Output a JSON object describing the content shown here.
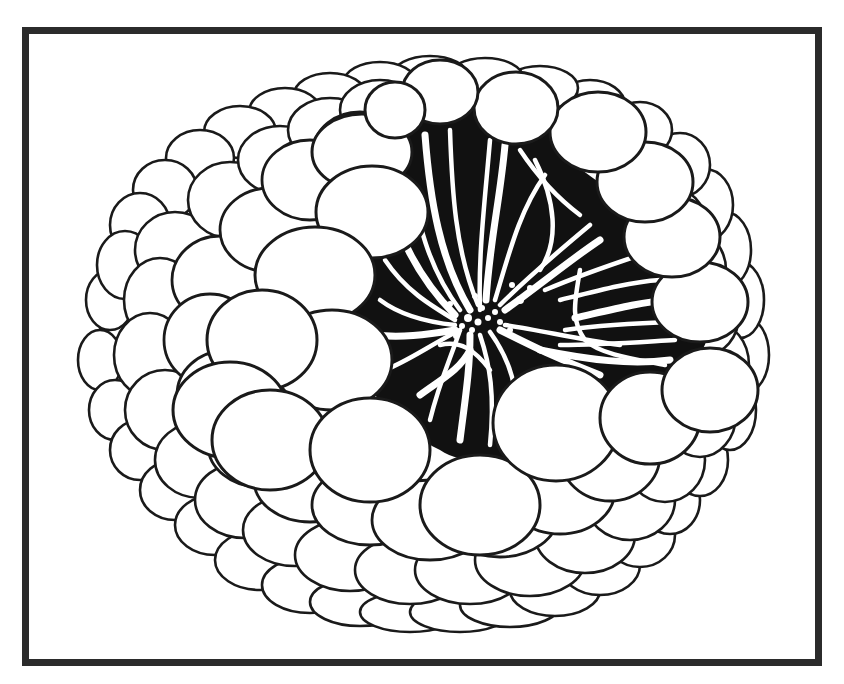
{
  "figure": {
    "width": 844,
    "height": 684,
    "background": "#ffffff",
    "ink": "#1a1a1a",
    "frame": {
      "x": 22,
      "y": 27,
      "w": 800,
      "h": 639,
      "stroke": 7,
      "color": "#2b2b2b"
    },
    "cavity": {
      "fill": "#111111",
      "path": "M 395 120 C 440 95 520 100 560 125 C 620 150 680 190 700 240 C 720 290 720 330 690 370 C 660 410 600 420 560 440 C 520 460 470 470 440 450 C 400 430 370 400 360 360 C 350 320 350 260 360 210 C 368 170 375 135 395 120 Z"
    },
    "strands": [
      "M 425 135 C 430 200 440 260 470 310",
      "M 450 130 C 452 190 455 250 478 305",
      "M 490 140 C 485 200 478 255 480 310",
      "M 505 145 C 500 200 490 240 486 300",
      "M 520 150 C 540 180 560 200 580 215",
      "M 535 160 C 555 200 560 240 540 270",
      "M 560 150 C 590 170 610 190 640 200",
      "M 545 175 C 520 210 510 250 495 300",
      "M 590 225 C 560 250 530 275 500 305",
      "M 600 240 C 570 260 540 285 505 310",
      "M 640 255 C 610 265 580 275 545 290",
      "M 660 280 C 630 282 600 290 560 300",
      "M 670 300 C 640 302 610 310 575 318",
      "M 675 322 C 640 323 600 325 565 330",
      "M 675 340 C 640 342 600 345 560 345",
      "M 670 360 C 630 365 590 360 540 350",
      "M 580 270 C 575 300 570 320 585 340 C 600 355 640 360 665 365",
      "M 410 180 C 420 230 430 270 460 310",
      "M 395 220 C 410 260 430 290 455 315",
      "M 385 260 C 405 290 430 305 455 320",
      "M 380 300 C 400 315 425 322 455 325",
      "M 375 335 C 400 338 425 335 455 330",
      "M 385 370 C 410 360 430 345 460 330",
      "M 460 330 C 450 360 440 380 430 420",
      "M 470 335 C 470 370 465 400 460 440",
      "M 480 335 C 490 365 495 395 490 445",
      "M 490 332 C 510 360 520 390 515 430",
      "M 500 330 C 530 345 560 360 600 375",
      "M 505 325 C 540 330 580 340 620 345",
      "M 440 345 C 460 340 475 350 490 370",
      "M 420 395 C 440 380 460 370 470 350"
    ],
    "granules": [
      [
        468,
        318,
        4
      ],
      [
        478,
        322,
        3.5
      ],
      [
        488,
        318,
        3
      ],
      [
        472,
        330,
        3
      ],
      [
        462,
        326,
        3
      ],
      [
        495,
        312,
        3
      ],
      [
        482,
        308,
        3
      ],
      [
        500,
        322,
        3
      ],
      [
        456,
        336,
        3
      ],
      [
        510,
        330,
        3
      ],
      [
        520,
        300,
        4
      ],
      [
        530,
        288,
        3
      ],
      [
        512,
        285,
        3
      ],
      [
        475,
        296,
        3
      ],
      [
        450,
        304,
        3
      ]
    ],
    "cell_layers": [
      {
        "name": "outer-rim",
        "cells": [
          [
            130,
            330,
            30,
            40
          ],
          [
            110,
            300,
            24,
            30
          ],
          [
            100,
            360,
            22,
            30
          ],
          [
            115,
            410,
            26,
            30
          ],
          [
            140,
            450,
            30,
            30
          ],
          [
            175,
            490,
            35,
            30
          ],
          [
            215,
            525,
            40,
            30
          ],
          [
            260,
            560,
            45,
            30
          ],
          [
            310,
            585,
            48,
            28
          ],
          [
            360,
            602,
            50,
            24
          ],
          [
            410,
            612,
            50,
            20
          ],
          [
            460,
            612,
            50,
            20
          ],
          [
            510,
            605,
            50,
            22
          ],
          [
            555,
            590,
            45,
            26
          ],
          [
            600,
            565,
            40,
            30
          ],
          [
            640,
            535,
            35,
            32
          ],
          [
            670,
            500,
            30,
            34
          ],
          [
            700,
            460,
            28,
            36
          ],
          [
            730,
            410,
            26,
            40
          ],
          [
            745,
            355,
            24,
            38
          ],
          [
            740,
            300,
            24,
            38
          ],
          [
            725,
            250,
            26,
            38
          ],
          [
            705,
            205,
            28,
            36
          ],
          [
            680,
            165,
            30,
            32
          ],
          [
            640,
            130,
            32,
            28
          ],
          [
            590,
            105,
            35,
            25
          ],
          [
            540,
            88,
            38,
            22
          ],
          [
            485,
            78,
            38,
            20
          ],
          [
            430,
            76,
            38,
            20
          ],
          [
            380,
            82,
            36,
            20
          ],
          [
            330,
            95,
            36,
            22
          ],
          [
            285,
            112,
            36,
            24
          ],
          [
            240,
            132,
            36,
            26
          ],
          [
            200,
            158,
            34,
            28
          ],
          [
            165,
            190,
            32,
            30
          ],
          [
            140,
            225,
            30,
            32
          ],
          [
            125,
            265,
            28,
            34
          ]
        ]
      },
      {
        "name": "second-ring",
        "cells": [
          [
            175,
            250,
            40,
            38
          ],
          [
            160,
            300,
            36,
            42
          ],
          [
            150,
            355,
            36,
            42
          ],
          [
            165,
            410,
            40,
            40
          ],
          [
            200,
            460,
            45,
            38
          ],
          [
            245,
            500,
            50,
            38
          ],
          [
            295,
            530,
            52,
            36
          ],
          [
            350,
            555,
            55,
            36
          ],
          [
            410,
            570,
            55,
            34
          ],
          [
            470,
            570,
            55,
            34
          ],
          [
            530,
            560,
            55,
            36
          ],
          [
            585,
            535,
            50,
            38
          ],
          [
            630,
            500,
            45,
            40
          ],
          [
            665,
            460,
            40,
            42
          ],
          [
            700,
            415,
            36,
            42
          ],
          [
            715,
            365,
            34,
            42
          ],
          [
            705,
            315,
            34,
            40
          ],
          [
            690,
            270,
            36,
            40
          ],
          [
            670,
            225,
            36,
            38
          ],
          [
            230,
            200,
            42,
            38
          ],
          [
            280,
            160,
            42,
            34
          ],
          [
            330,
            130,
            42,
            32
          ],
          [
            380,
            110,
            40,
            30
          ]
        ]
      },
      {
        "name": "third-ring",
        "cells": [
          [
            220,
            280,
            48,
            44
          ],
          [
            210,
            340,
            46,
            46
          ],
          [
            225,
            395,
            48,
            44
          ],
          [
            260,
            445,
            52,
            42
          ],
          [
            310,
            480,
            56,
            42
          ],
          [
            370,
            505,
            58,
            40
          ],
          [
            430,
            520,
            58,
            40
          ],
          [
            500,
            515,
            58,
            42
          ],
          [
            560,
            490,
            55,
            44
          ],
          [
            610,
            455,
            50,
            46
          ],
          [
            270,
            230,
            50,
            42
          ],
          [
            310,
            180,
            48,
            40
          ],
          [
            360,
            150,
            46,
            38
          ]
        ]
      },
      {
        "name": "front-ring",
        "cells": [
          [
            362,
            152,
            50,
            38
          ],
          [
            372,
            212,
            56,
            46
          ],
          [
            315,
            275,
            60,
            48
          ],
          [
            332,
            360,
            60,
            50
          ],
          [
            262,
            340,
            55,
            50
          ],
          [
            230,
            410,
            57,
            48
          ],
          [
            270,
            440,
            58,
            50
          ],
          [
            370,
            450,
            60,
            52
          ],
          [
            480,
            505,
            60,
            50
          ],
          [
            556,
            423,
            63,
            58
          ],
          [
            650,
            418,
            50,
            46
          ],
          [
            710,
            390,
            48,
            42
          ],
          [
            700,
            302,
            48,
            40
          ],
          [
            672,
            237,
            48,
            40
          ],
          [
            645,
            182,
            48,
            40
          ],
          [
            598,
            132,
            48,
            40
          ],
          [
            516,
            108,
            42,
            36
          ],
          [
            440,
            92,
            38,
            32
          ],
          [
            395,
            110,
            30,
            28
          ]
        ]
      }
    ]
  }
}
